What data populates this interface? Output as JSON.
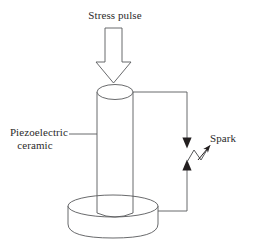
{
  "figure": {
    "background_color": "#ffffff",
    "stroke_color": "#58595b",
    "arrowhead_color": "#231f20",
    "text_color": "#2b2b2b"
  },
  "labels": {
    "stress_pulse": "Stress pulse",
    "piezoelectric_line1": "Piezoelectric",
    "piezoelectric_line2": "ceramic",
    "spark": "Spark"
  },
  "parts": {
    "stress_arrow": "block-arrow-down",
    "ceramic_column": "vertical-cylinder",
    "base_disc": "cylindrical-base",
    "top_wire": "electrode-wire-top",
    "bottom_wire": "electrode-wire-bottom",
    "spark_gap": "spark-gap-electrodes",
    "lightning": "zigzag-spark",
    "leader_line": "callout-leader-line",
    "spark_pointer": "spark-pointer-arrow"
  }
}
